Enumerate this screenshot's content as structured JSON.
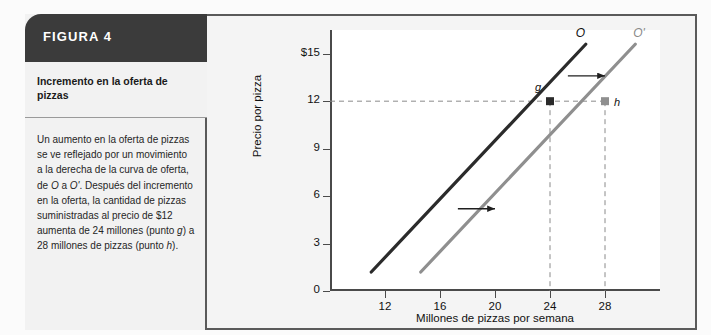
{
  "figure": {
    "header_label": "FIGURA 4",
    "subtitle": "Incremento en la oferta de pizzas",
    "caption": "Un aumento en la oferta de pizzas se ve reflejado por un movimiento a la derecha de la curva de oferta, de O a O'. Después del incremento en la oferta, la cantidad de pizzas suministradas al precio de $12 aumenta de 24 millones (punto g) a 28 millones de pizzas (punto h).",
    "header_bg": "#3b3b3b",
    "panel_bg": "#f2f2f2",
    "border_color": "#5a5a5a"
  },
  "chart_data": {
    "type": "line",
    "title": "",
    "xlabel": "Millones de pizzas por semana",
    "ylabel": "Precio por pizza",
    "xlim": [
      8,
      32
    ],
    "ylim": [
      0,
      16.5
    ],
    "grid": false,
    "legend": "inline-curve-labels",
    "xticks": [
      12,
      16,
      20,
      24,
      28
    ],
    "xtick_labels": [
      "12",
      "16",
      "20",
      "24",
      "28"
    ],
    "yticks": [
      0,
      3,
      6,
      9,
      12,
      15
    ],
    "ytick_labels": [
      "0",
      "3",
      "6",
      "9",
      "12",
      "$15"
    ],
    "series": [
      {
        "name": "O",
        "label": "O",
        "color": "#2b2b2b",
        "points": [
          [
            11,
            1.2
          ],
          [
            26.6,
            15.6
          ]
        ]
      },
      {
        "name": "O'",
        "label": "O'",
        "color": "#8f8f8f",
        "points": [
          [
            14.6,
            1.2
          ],
          [
            30.2,
            15.6
          ]
        ]
      }
    ],
    "points": [
      {
        "label": "g",
        "x": 24,
        "y": 12,
        "color": "#2b2b2b"
      },
      {
        "label": "h",
        "x": 28,
        "y": 12,
        "color": "#8f8f8f"
      }
    ],
    "annotations": [
      {
        "type": "shift-arrow",
        "from": [
          17.3,
          5.2
        ],
        "to": [
          20.0,
          5.2
        ]
      },
      {
        "type": "shift-arrow",
        "from": [
          25.3,
          13.6
        ],
        "to": [
          28.0,
          13.6
        ]
      },
      {
        "type": "guide-line",
        "orientation": "horizontal",
        "value": 12
      },
      {
        "type": "guide-line",
        "orientation": "vertical",
        "value": 24
      },
      {
        "type": "guide-line",
        "orientation": "vertical",
        "value": 28
      }
    ]
  }
}
